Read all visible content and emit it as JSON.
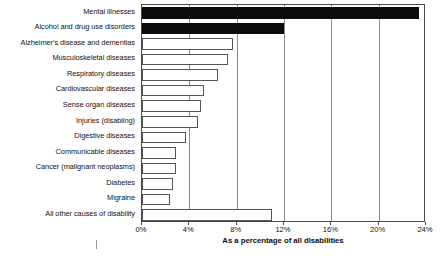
{
  "chart_data": {
    "type": "bar",
    "orientation": "horizontal",
    "title": "",
    "xlabel": "As a percentage of all disabilities",
    "ylabel": "",
    "xlim": [
      0,
      24
    ],
    "xticks": [
      "0%",
      "4%",
      "8%",
      "12%",
      "16%",
      "20%",
      "24%"
    ],
    "xtick_values": [
      0,
      4,
      8,
      12,
      16,
      20,
      24
    ],
    "grid": true,
    "grid_axis": "x",
    "legend": "none",
    "categories": [
      "Mental illnesses",
      "Alcohol and drug use disorders",
      "Alzheimer's disease and dementias",
      "Musculoskeletal diseases",
      "Respiratory diseases",
      "Cardiovascular diseases",
      "Sense organ diseases",
      "Injuries (disabling)",
      "Digestive diseases",
      "Communicable diseases",
      "Cancer (malignant neoplasms)",
      "Diabetes",
      "Migraine",
      "All other causes of disability"
    ],
    "values": [
      23.4,
      12.0,
      7.7,
      7.3,
      6.4,
      5.2,
      5.0,
      4.7,
      3.7,
      2.9,
      2.9,
      2.6,
      2.4,
      11.0
    ],
    "highlighted": [
      true,
      true,
      false,
      false,
      false,
      false,
      false,
      false,
      false,
      false,
      false,
      false,
      false,
      false
    ],
    "colors": {
      "bar_fill_highlight": "#0b0b0b",
      "bar_fill_default": "#ffffff",
      "bar_outline": "#555555",
      "grid": "#8d8d8d",
      "frame": "#4a4a4a",
      "text": "#111111",
      "background": "#ffffff"
    }
  }
}
